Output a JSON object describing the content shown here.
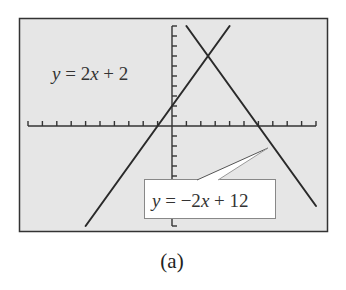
{
  "figure": {
    "caption": "(a)",
    "background_color": "#ffffff",
    "screen_color": "#e6e6e6",
    "frame_color": "#333333",
    "line_color": "#2a2a2a"
  },
  "labels": {
    "line1": {
      "y": "y",
      "eq": " = 2",
      "x": "x",
      "rest": " + 2",
      "full": "y = 2x + 2"
    },
    "line2": {
      "y": "y",
      "eq": " = −2",
      "x": "x",
      "rest": " + 12",
      "full": "y = −2x + 12"
    }
  },
  "chart_data": {
    "type": "line",
    "title": "",
    "xlabel": "",
    "ylabel": "",
    "xlim": [
      -10,
      10
    ],
    "ylim": [
      -10,
      10
    ],
    "x_tick_step": 1,
    "y_tick_step": 1,
    "grid": false,
    "legend": "none (inline labels)",
    "series": [
      {
        "name": "y = 2x + 2",
        "slope": 2,
        "intercept": 2,
        "x": [
          -6,
          4
        ],
        "y": [
          -10,
          10
        ]
      },
      {
        "name": "y = -2x + 12",
        "slope": -2,
        "intercept": 12,
        "x": [
          1,
          10
        ],
        "y": [
          10,
          -8
        ]
      }
    ],
    "annotations": [
      {
        "text": "y = 2x + 2",
        "position": "upper left"
      },
      {
        "text": "y = -2x + 12",
        "position": "lower right boxed callout",
        "points_to": [
          6.7,
          -2.2
        ]
      }
    ],
    "intersection": {
      "x": 2.5,
      "y": 7
    },
    "x_intercepts": [
      {
        "series": "y = 2x + 2",
        "x": -1
      },
      {
        "series": "y = -2x + 12",
        "x": 6
      }
    ],
    "caption": "(a)"
  }
}
